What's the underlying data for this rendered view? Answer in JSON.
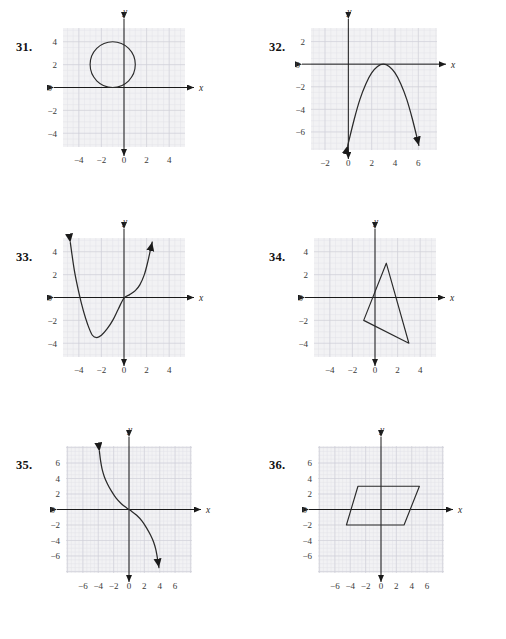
{
  "page": {
    "kind": "textbook-exercise-figures",
    "background_color": "#ffffff",
    "ink_color": "#1a1a1a",
    "grid_minor_color": "#e3e3e8",
    "grid_major_color": "#cfcfd6",
    "plot_fill_color": "#f2f2f4"
  },
  "problems": [
    {
      "number": "31.",
      "name": "circle-graph",
      "axis_labels": {
        "x": "x",
        "y": "y"
      },
      "chart_data": {
        "type": "scatter",
        "shape": "circle",
        "title": "",
        "xlabel": "x",
        "ylabel": "y",
        "xlim": [
          -5.4,
          5.4
        ],
        "ylim": [
          -5.2,
          5.2
        ],
        "grid": true,
        "xticks": [
          -4,
          -2,
          0,
          2,
          4
        ],
        "yticks": [
          4,
          2,
          0,
          -2,
          -4
        ],
        "xtick_labels": [
          "−4",
          "−2",
          "0",
          "2",
          "4"
        ],
        "ytick_labels": [
          "4",
          "2",
          "0",
          "−2",
          "−4"
        ],
        "center": [
          -1,
          2
        ],
        "radius": 2,
        "closed": true,
        "arrows": []
      }
    },
    {
      "number": "32.",
      "name": "downward-parabola-graph",
      "axis_labels": {
        "x": "x",
        "y": "y"
      },
      "chart_data": {
        "type": "line",
        "shape": "parabola-down",
        "title": "",
        "xlabel": "x",
        "ylabel": "y",
        "xlim": [
          -3.2,
          7.6
        ],
        "ylim": [
          -7.6,
          3.2
        ],
        "grid": true,
        "xticks": [
          -2,
          0,
          2,
          4,
          6
        ],
        "yticks": [
          2,
          0,
          -2,
          -4,
          -6
        ],
        "xtick_labels": [
          "−2",
          "0",
          "2",
          "4",
          "6"
        ],
        "ytick_labels": [
          "2",
          "0",
          "−2",
          "−4",
          "−6"
        ],
        "vertex": [
          3,
          0
        ],
        "roots": [
          3,
          3
        ],
        "equation_note": "y = -0.78(x-3)^2",
        "x": [
          -0.05,
          0.5,
          1,
          1.5,
          2,
          2.5,
          3,
          3.5,
          4,
          4.5,
          5,
          5.5,
          6.05
        ],
        "y": [
          -7.2,
          -4.9,
          -3.1,
          -1.75,
          -0.78,
          -0.2,
          0,
          -0.2,
          -0.78,
          -1.75,
          -3.1,
          -4.9,
          -7.2
        ],
        "arrows": [
          "start-down",
          "end-down"
        ]
      }
    },
    {
      "number": "33.",
      "name": "cubic-curve-graph",
      "axis_labels": {
        "x": "x",
        "y": "y"
      },
      "chart_data": {
        "type": "line",
        "shape": "cubic",
        "title": "",
        "xlabel": "x",
        "ylabel": "y",
        "xlim": [
          -5.4,
          5.4
        ],
        "ylim": [
          -5.2,
          5.2
        ],
        "grid": true,
        "xticks": [
          -4,
          -2,
          0,
          2,
          4
        ],
        "yticks": [
          4,
          2,
          0,
          -2,
          -4
        ],
        "xtick_labels": [
          "−4",
          "−2",
          "0",
          "2",
          "4"
        ],
        "ytick_labels": [
          "4",
          "2",
          "0",
          "−2",
          "−4"
        ],
        "local_min": [
          -2.6,
          -3.5
        ],
        "inflection": [
          0,
          0
        ],
        "x": [
          -4.75,
          -4.4,
          -4.0,
          -3.6,
          -3.2,
          -2.8,
          -2.4,
          -2.0,
          -1.5,
          -1.0,
          -0.5,
          0.0,
          0.5,
          1.0,
          1.4,
          1.8,
          2.1,
          2.35,
          2.5
        ],
        "y": [
          4.8,
          2.4,
          0.45,
          -1.15,
          -2.4,
          -3.3,
          -3.5,
          -3.3,
          -2.75,
          -2.0,
          -1.0,
          -0.05,
          0.25,
          0.6,
          1.1,
          2.0,
          3.1,
          4.2,
          4.85
        ],
        "arrows": [
          "start-up",
          "end-up"
        ]
      }
    },
    {
      "number": "34.",
      "name": "triangle-graph",
      "axis_labels": {
        "x": "x",
        "y": "y"
      },
      "chart_data": {
        "type": "scatter",
        "shape": "triangle",
        "title": "",
        "xlabel": "x",
        "ylabel": "y",
        "xlim": [
          -5.4,
          5.4
        ],
        "ylim": [
          -5.2,
          5.2
        ],
        "grid": true,
        "xticks": [
          -4,
          -2,
          0,
          2,
          4
        ],
        "yticks": [
          4,
          2,
          0,
          -2,
          -4
        ],
        "xtick_labels": [
          "−4",
          "−2",
          "0",
          "2",
          "4"
        ],
        "ytick_labels": [
          "4",
          "2",
          "0",
          "−2",
          "−4"
        ],
        "vertices": [
          [
            1,
            3
          ],
          [
            3,
            -4
          ],
          [
            -1,
            -2
          ]
        ],
        "closed": true,
        "arrows": []
      }
    },
    {
      "number": "35.",
      "name": "decreasing-s-curve-graph",
      "axis_labels": {
        "x": "x",
        "y": "y"
      },
      "chart_data": {
        "type": "line",
        "shape": "odd-decreasing",
        "title": "",
        "xlabel": "x",
        "ylabel": "y",
        "xlim": [
          -8.2,
          8.2
        ],
        "ylim": [
          -8.2,
          8.2
        ],
        "grid": true,
        "xticks": [
          -6,
          -4,
          -2,
          0,
          2,
          4,
          6
        ],
        "yticks": [
          6,
          4,
          2,
          0,
          -2,
          -4,
          -6
        ],
        "xtick_labels": [
          "−6",
          "−4",
          "−2",
          "0",
          "2",
          "4",
          "6"
        ],
        "ytick_labels": [
          "6",
          "4",
          "2",
          "0",
          "−2",
          "−4",
          "−6"
        ],
        "passes_through_origin": true,
        "x": [
          -3.85,
          -3.7,
          -3.5,
          -3.2,
          -2.8,
          -2.3,
          -1.7,
          -1.0,
          -0.3,
          0.3,
          1.0,
          1.7,
          2.3,
          2.8,
          3.2,
          3.5,
          3.7,
          3.9
        ],
        "y": [
          7.5,
          6.3,
          5.2,
          4.2,
          3.3,
          2.4,
          1.5,
          0.75,
          0.2,
          -0.2,
          -0.75,
          -1.5,
          -2.4,
          -3.3,
          -4.2,
          -5.2,
          -6.3,
          -7.5
        ],
        "arrows": [
          "start-up",
          "end-down"
        ]
      }
    },
    {
      "number": "36.",
      "name": "parallelogram-graph",
      "axis_labels": {
        "x": "x",
        "y": "y"
      },
      "chart_data": {
        "type": "scatter",
        "shape": "parallelogram",
        "title": "",
        "xlabel": "x",
        "ylabel": "y",
        "xlim": [
          -8.2,
          8.2
        ],
        "ylim": [
          -8.2,
          8.2
        ],
        "grid": true,
        "xticks": [
          -6,
          -4,
          -2,
          0,
          2,
          4,
          6
        ],
        "yticks": [
          6,
          4,
          2,
          0,
          -2,
          -4,
          -6
        ],
        "xtick_labels": [
          "−6",
          "−4",
          "−2",
          "0",
          "2",
          "4",
          "6"
        ],
        "ytick_labels": [
          "6",
          "4",
          "2",
          "0",
          "−2",
          "−4",
          "−6"
        ],
        "vertices": [
          [
            -3,
            3
          ],
          [
            5,
            3
          ],
          [
            3,
            -2
          ],
          [
            -4.5,
            -2
          ]
        ],
        "closed": true,
        "arrows": []
      }
    }
  ]
}
